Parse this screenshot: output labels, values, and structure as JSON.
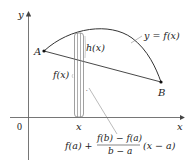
{
  "diagram": {
    "axes": {
      "x_label": "x",
      "y_label": "y",
      "origin_label": "0"
    },
    "points": {
      "A": "A",
      "B": "B"
    },
    "labels": {
      "curve": "y = f(x)",
      "gap": "h(x)",
      "height": "f(x)",
      "x_tick": "x"
    },
    "formula": {
      "prefix": "f(a) +",
      "numerator": "f(b) − f(a)",
      "denominator": "b − a",
      "suffix": "(x − a)"
    },
    "colors": {
      "ink": "#222222",
      "axis": "#666666",
      "background": "#ffffff"
    }
  }
}
